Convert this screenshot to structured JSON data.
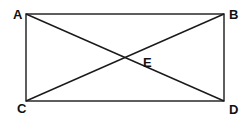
{
  "diagram": {
    "type": "rectangle-with-diagonals",
    "stroke_color": "#1a1a1a",
    "points": {
      "A": {
        "label": "A",
        "x": 26,
        "y": 14
      },
      "B": {
        "label": "B",
        "x": 224,
        "y": 14
      },
      "C": {
        "label": "C",
        "x": 26,
        "y": 101
      },
      "D": {
        "label": "D",
        "x": 224,
        "y": 101
      },
      "E": {
        "label": "E",
        "x": 125,
        "y": 58
      }
    },
    "segments": [
      "AB",
      "BD",
      "DC",
      "CA",
      "AD",
      "BC"
    ]
  }
}
